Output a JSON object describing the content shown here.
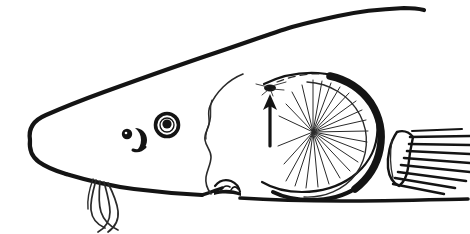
{
  "figure": {
    "title": "Fish head lateral profile line drawing",
    "view": "lateral-left-facing",
    "medium": "ink line drawing",
    "background_color": "#ffffff",
    "ink_color": "#141414",
    "canvas": {
      "width": 470,
      "height": 234
    }
  },
  "parts": {
    "dorsal_contour": {
      "label": "dorsal head contour",
      "description": "long sweeping line from snout tip rising to upper right edge"
    },
    "ventral_contour": {
      "label": "ventral head contour",
      "description": "lower jaw and belly line running to right edge"
    },
    "snout": {
      "label": "snout",
      "description": "elongated rounded rostrum at left"
    },
    "snout_tip": {
      "label": "snout tip",
      "description": "blunt rounded anterior end"
    },
    "eye": {
      "label": "eye",
      "description": "concentric rings with solid dark pupil",
      "outer_radius_px": 11,
      "pupil_radius_px": 5
    },
    "nostril": {
      "label": "nostril",
      "description": "dark dot paired with crescent flap"
    },
    "barbels": {
      "label": "barbels",
      "count": 4,
      "description": "thin whisker-like filaments hanging from underside of snout, crossing one another"
    },
    "operculum": {
      "label": "operculum / gill cover",
      "description": "large oval plate with thick dark posterior margin"
    },
    "gill_filaments": {
      "label": "gill filaments",
      "count": 22,
      "description": "radiating fan of fine lines emanating from a focal point within the gill cover"
    },
    "preopercular_margin": {
      "label": "preopercular margin",
      "description": "thin irregular vertical line separating cheek from gill cover"
    },
    "jaw_hinge": {
      "label": "jaw hinge cluster",
      "description": "small knotted cluster of shapes at the lower jaw articulation"
    },
    "pectoral_fin": {
      "label": "pectoral fin",
      "ray_count": 9,
      "description": "triangular fin with parallel dark rays at lower right"
    }
  },
  "annotation": {
    "arrow": {
      "label": "indicator arrow",
      "direction": "up",
      "description": "vertical arrow pointing upward to a marked spot on the head"
    },
    "marker": {
      "label": "marked spot",
      "description": "small dark blob with fine radiating hairs at the arrow tip"
    }
  }
}
